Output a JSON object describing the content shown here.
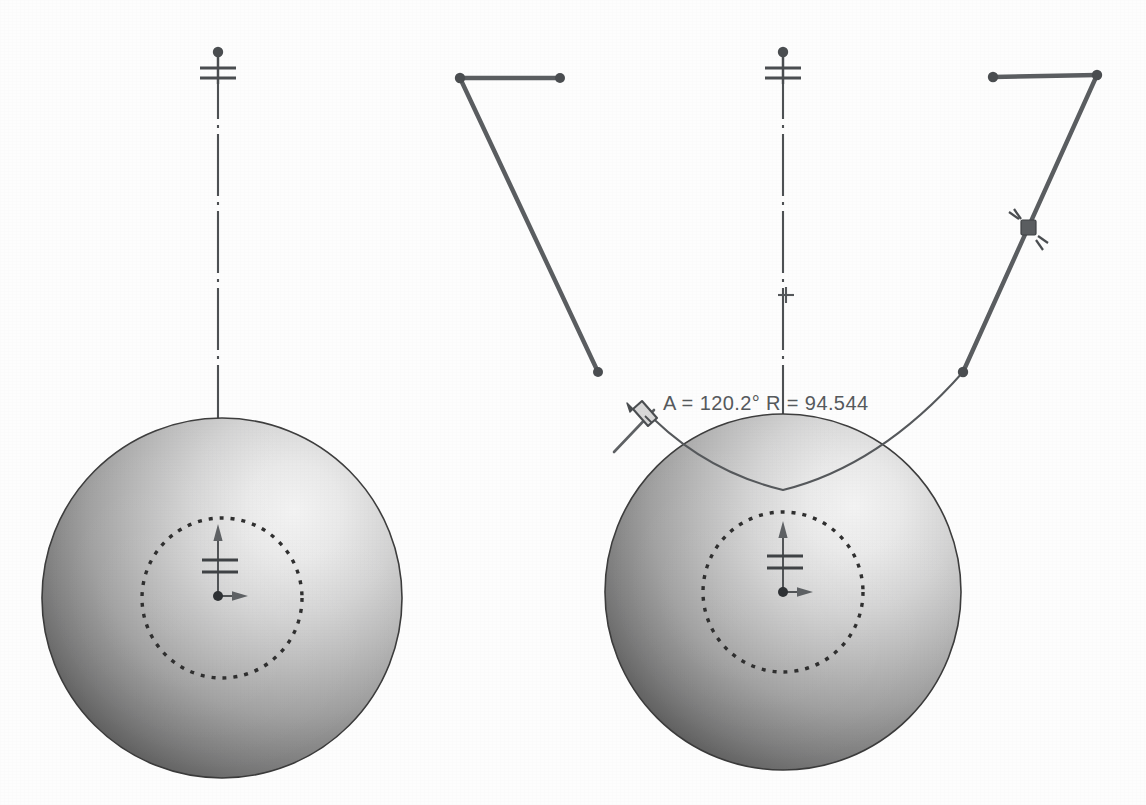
{
  "document": {
    "title": "Sphere sketch — arc dimension edit",
    "background_color": "#fdfdfd",
    "width": 1146,
    "height": 805
  },
  "annotations": {
    "dimension_readout": "A = 120.2° R = 94.544",
    "angle_value": "120.2°",
    "radius_value": "94.544",
    "angle_label": "A",
    "radius_label": "R",
    "readout_x": 663,
    "readout_y": 402
  },
  "colors": {
    "line": "#4a4d50",
    "sketch_line": "#5a5d60",
    "thin_curve": "#55585b",
    "centerline": "#4d5053",
    "text": "#55595c",
    "sphere_highlight": "#ededed",
    "sphere_mid": "#a9a9a9",
    "sphere_shadow": "#3b3b3b",
    "sphere_edge": "#3a3a3a",
    "dashed_circle": "#2f2f2f",
    "cursor": "#5e6164"
  },
  "views": [
    {
      "name": "left-view",
      "sphere": {
        "cx": 222,
        "cy": 598,
        "r": 180,
        "inner_dashed_r": 80
      },
      "centerline": {
        "x": 218,
        "y_top": 57,
        "y_bottom": 600
      },
      "top_datum_marker": {
        "x": 218,
        "y": 52
      },
      "origin_triad": {
        "x": 218,
        "y": 596
      }
    },
    {
      "name": "right-view",
      "sphere": {
        "cx": 783,
        "cy": 592,
        "r": 178,
        "inner_dashed_r": 80
      },
      "centerline": {
        "x": 783,
        "y_top": 57,
        "y_bottom": 596
      },
      "top_datum_marker": {
        "x": 783,
        "y": 52
      },
      "origin_triad": {
        "x": 783,
        "y": 592
      },
      "plus_mark": {
        "x": 786,
        "y": 295
      }
    }
  ],
  "sketch_entities": {
    "left_branch": {
      "horizontal": {
        "x1": 460,
        "y1": 78,
        "x2": 560,
        "y2": 78
      },
      "diagonal": {
        "x1": 460,
        "y1": 78,
        "x2": 598,
        "y2": 372
      },
      "points": [
        {
          "x": 460,
          "y": 78
        },
        {
          "x": 560,
          "y": 78
        },
        {
          "x": 598,
          "y": 372
        }
      ]
    },
    "right_branch": {
      "horizontal": {
        "x1": 993,
        "y1": 77,
        "x2": 1097,
        "y2": 75
      },
      "diagonal": {
        "x1": 1097,
        "y1": 75,
        "x2": 963,
        "y2": 372
      },
      "points": [
        {
          "x": 993,
          "y": 77
        },
        {
          "x": 1097,
          "y": 75
        },
        {
          "x": 963,
          "y": 372
        }
      ],
      "drag_handle": {
        "x": 1028,
        "y": 227
      }
    },
    "arc": {
      "start": {
        "x": 641,
        "y": 406
      },
      "end": {
        "x": 963,
        "y": 372
      },
      "low_point": {
        "x": 783,
        "y": 490
      },
      "radius": "94.544",
      "angle": "120.2°"
    }
  },
  "cursor": {
    "type": "pencil-cursor",
    "x": 638,
    "y": 420
  }
}
